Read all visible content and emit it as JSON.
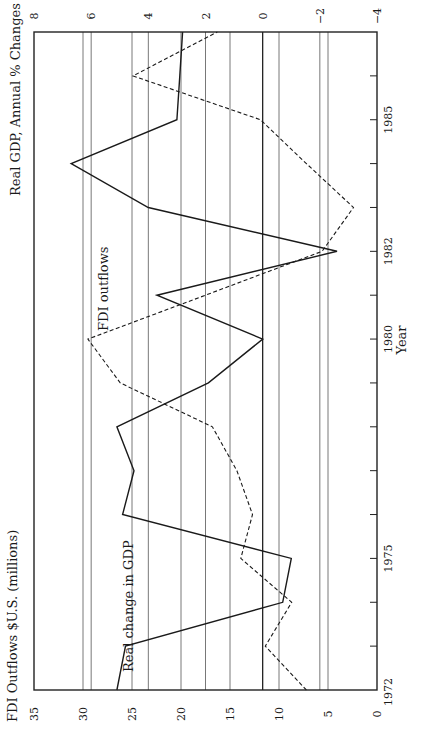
{
  "chart_data": {
    "type": "line",
    "orientation": "rotated-90-ccw",
    "xlabel": "Year",
    "x_ticks_labeled": [
      "1972",
      "1975",
      "1980",
      "1982",
      "1985"
    ],
    "x_range": [
      1972,
      1987
    ],
    "x": [
      1972,
      1973,
      1974,
      1975,
      1976,
      1977,
      1978,
      1979,
      1980,
      1981,
      1982,
      1983,
      1984,
      1985,
      1986,
      1987
    ],
    "left_axis": {
      "title": "FDI Outflows $U.S. (millions)",
      "range": [
        0,
        35
      ],
      "ticks": [
        "0",
        "5",
        "10",
        "15",
        "20",
        "25",
        "30",
        "35"
      ]
    },
    "right_axis": {
      "title": "Real GDP, Annual % Changes",
      "range": [
        -4,
        8
      ],
      "ticks": [
        "−4",
        "−2",
        "0",
        "2",
        "4",
        "6",
        "8"
      ]
    },
    "grid": true,
    "series": [
      {
        "name": "Real change in GDP",
        "axis": "right",
        "style": "solid",
        "values": [
          5.1,
          4.8,
          -0.7,
          -1.0,
          4.9,
          4.5,
          5.1,
          1.9,
          0.0,
          3.7,
          -2.6,
          4.0,
          6.7,
          3.0,
          2.9,
          2.8
        ]
      },
      {
        "name": "FDI outflows",
        "axis": "left",
        "style": "dashed",
        "values": [
          7.2,
          11.4,
          8.7,
          13.9,
          12.7,
          14.3,
          16.8,
          26.2,
          29.5,
          17.5,
          5.6,
          2.4,
          7.2,
          11.9,
          24.9,
          16.3
        ]
      }
    ],
    "annotations": [
      {
        "text": "FDI outflows",
        "series": "FDI outflows"
      },
      {
        "text": "Real change in GDP",
        "series": "Real change in GDP"
      }
    ]
  }
}
